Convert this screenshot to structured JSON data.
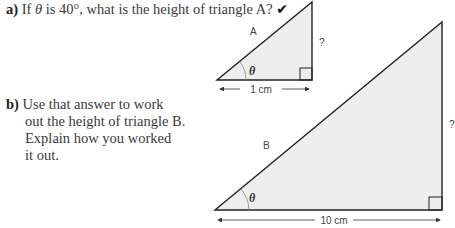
{
  "questions": {
    "a": {
      "label": "a)",
      "text_before": "If ",
      "symbol": "θ",
      "text_after": " is 40°, what is the height of triangle A?",
      "mark": "✔"
    },
    "b": {
      "label": "b)",
      "line1": "Use that answer to work",
      "line2": "out the height of triangle B.",
      "line3": "Explain how you worked",
      "line4": "it out."
    }
  },
  "triangle_a": {
    "name": "A",
    "angle": "θ",
    "base": "1 cm",
    "height": "?"
  },
  "triangle_b": {
    "name": "B",
    "angle": "θ",
    "base": "10 cm",
    "height": "?"
  },
  "colors": {
    "fill": "#eeeeee",
    "stroke": "#222222",
    "text": "#3a3a3a"
  }
}
